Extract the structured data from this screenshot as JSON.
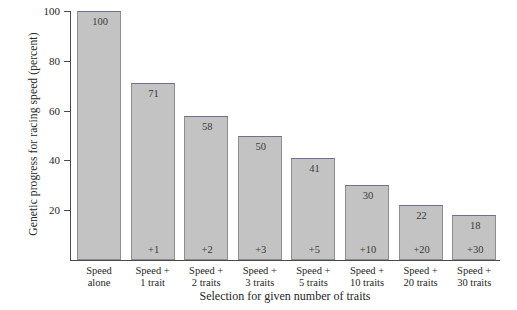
{
  "chart_data": {
    "type": "bar",
    "title": "",
    "xlabel": "Selection for given number of traits",
    "ylabel": "Genetic progress for racing speed (percent)",
    "ylim": [
      0,
      100
    ],
    "yticks": [
      20,
      40,
      60,
      80,
      100
    ],
    "grid": false,
    "legend": "none",
    "categories": [
      "Speed alone",
      "Speed + 1 trait",
      "Speed + 2 traits",
      "Speed + 3 traits",
      "Speed + 5 traits",
      "Speed + 10 traits",
      "Speed + 20 traits",
      "Speed + 30 traits"
    ],
    "values": [
      100,
      71,
      58,
      50,
      41,
      30,
      22,
      18
    ],
    "bar_inner_labels": [
      "",
      "+1",
      "+2",
      "+3",
      "+5",
      "+10",
      "+20",
      "+30"
    ],
    "bar_color": "#c3c3c3",
    "bar_edge_color": "#8e8e8e"
  },
  "axis": {
    "y_title": "Genetic progress for racing speed (percent)",
    "x_title": "Selection for given number of traits",
    "y_ticks": [
      {
        "label": "100",
        "value": 100
      },
      {
        "label": "80",
        "value": 80
      },
      {
        "label": "60",
        "value": 60
      },
      {
        "label": "40",
        "value": 40
      },
      {
        "label": "20",
        "value": 20
      }
    ]
  },
  "bars": [
    {
      "value_label": "100",
      "delta_label": "",
      "line1": "Speed",
      "line2": "alone"
    },
    {
      "value_label": "71",
      "delta_label": "+1",
      "line1": "Speed +",
      "line2": "1 trait"
    },
    {
      "value_label": "58",
      "delta_label": "+2",
      "line1": "Speed +",
      "line2": "2 traits"
    },
    {
      "value_label": "50",
      "delta_label": "+3",
      "line1": "Speed +",
      "line2": "3 traits"
    },
    {
      "value_label": "41",
      "delta_label": "+5",
      "line1": "Speed +",
      "line2": "5 traits"
    },
    {
      "value_label": "30",
      "delta_label": "+10",
      "line1": "Speed +",
      "line2": "10 traits"
    },
    {
      "value_label": "22",
      "delta_label": "+20",
      "line1": "Speed +",
      "line2": "20 traits"
    },
    {
      "value_label": "18",
      "delta_label": "+30",
      "line1": "Speed +",
      "line2": "30 traits"
    }
  ]
}
